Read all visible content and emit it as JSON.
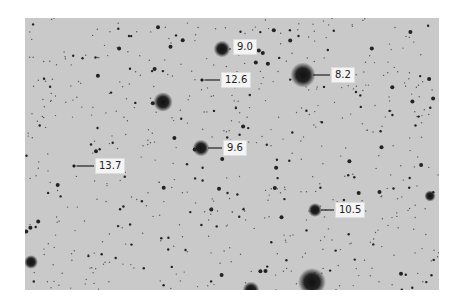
{
  "image": {
    "description": "Grayscale star field photograph with magnitude labels",
    "background_color": "#c9c9c9",
    "star_color": "#1a1a1a",
    "label_background": "#f4f4f4"
  },
  "bright_stars": [
    {
      "x": 138,
      "y": 84,
      "r": 7
    },
    {
      "x": 226,
      "y": 272,
      "r": 6
    },
    {
      "x": 287,
      "y": 264,
      "r": 10
    },
    {
      "x": 405,
      "y": 178,
      "r": 4
    },
    {
      "x": 6,
      "y": 244,
      "r": 5
    }
  ],
  "labeled_stars": [
    {
      "id": "star-9-0",
      "magnitude": "9.0",
      "star_x": 197,
      "star_y": 31,
      "star_r": 6,
      "label_x": 208,
      "label_y": 21,
      "line_end_x": 206
    },
    {
      "id": "star-8-2",
      "magnitude": "8.2",
      "star_x": 278,
      "star_y": 57,
      "star_r": 9,
      "label_x": 306,
      "label_y": 49,
      "line_end_x": 305
    },
    {
      "id": "star-12-6",
      "magnitude": "12.6",
      "star_x": 177,
      "star_y": 62,
      "star_r": 1.5,
      "label_x": 196,
      "label_y": 54,
      "line_end_x": 195
    },
    {
      "id": "star-9-6",
      "magnitude": "9.6",
      "star_x": 176,
      "star_y": 130,
      "star_r": 6,
      "label_x": 198,
      "label_y": 122,
      "line_end_x": 197
    },
    {
      "id": "star-13-7",
      "magnitude": "13.7",
      "star_x": 49,
      "star_y": 148,
      "star_r": 1.5,
      "label_x": 70,
      "label_y": 140,
      "line_end_x": 69
    },
    {
      "id": "star-10-5",
      "magnitude": "10.5",
      "star_x": 290,
      "star_y": 192,
      "star_r": 5,
      "label_x": 310,
      "label_y": 184,
      "line_end_x": 309
    }
  ]
}
